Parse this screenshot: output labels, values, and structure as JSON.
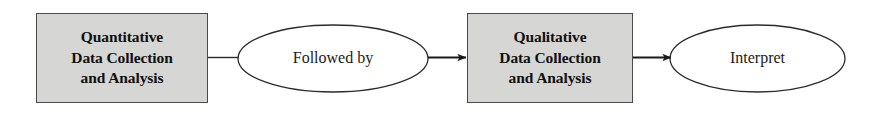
{
  "diagram": {
    "type": "flowchart",
    "orientation": "left-to-right",
    "background_color": "#ffffff",
    "box_fill_color": "#d6d6d4",
    "box_border_color": "#4a4a4a",
    "stroke_color": "#1a1a1a",
    "nodes": [
      {
        "id": "quantitative",
        "shape": "rectangle",
        "lines": [
          "Quantitative",
          "Data Collection",
          "and Analysis"
        ],
        "text": "Quantitative Data Collection and Analysis",
        "bold": true,
        "fill": "#d6d6d4"
      },
      {
        "id": "followed-by",
        "shape": "ellipse",
        "text": "Followed by",
        "bold": false,
        "fill": "#ffffff"
      },
      {
        "id": "qualitative",
        "shape": "rectangle",
        "lines": [
          "Qualitative",
          "Data Collection",
          "and Analysis"
        ],
        "text": "Qualitative Data Collection and Analysis",
        "bold": true,
        "fill": "#d6d6d4"
      },
      {
        "id": "interpret",
        "shape": "ellipse",
        "text": "Interpret",
        "bold": false,
        "fill": "#ffffff"
      }
    ],
    "connectors": [
      {
        "id": "quant-to-followed",
        "from": "quantitative",
        "to": "followed-by",
        "arrowhead": false
      },
      {
        "id": "followed-to-qual",
        "from": "followed-by",
        "to": "qualitative",
        "arrowhead": true
      },
      {
        "id": "qual-to-interpret",
        "from": "qualitative",
        "to": "interpret",
        "arrowhead": true
      }
    ]
  }
}
